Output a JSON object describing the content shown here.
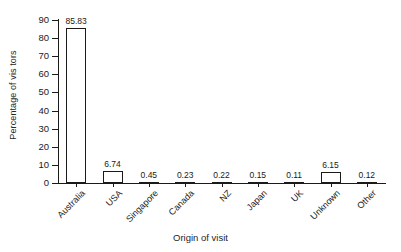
{
  "chart_data": {
    "type": "bar",
    "title": "",
    "xlabel": "Origin of visit",
    "ylabel": "Percentage of vis tors",
    "categories": [
      "Australia",
      "USA",
      "Singapore",
      "Canada",
      "NZ",
      "Japan",
      "UK",
      "Unknown",
      "Other"
    ],
    "values": [
      85.83,
      6.74,
      0.45,
      0.23,
      0.22,
      0.15,
      0.11,
      6.15,
      0.12
    ],
    "value_labels": [
      "85.83",
      "6.74",
      "0.45",
      "0.23",
      "0.22",
      "0.15",
      "0.11",
      "6.15",
      "0.12"
    ],
    "ylim": [
      0,
      90
    ],
    "y_ticks": [
      0,
      10,
      20,
      30,
      40,
      50,
      60,
      70,
      80,
      90
    ],
    "y_tick_labels": [
      "0",
      "10",
      "20",
      "30",
      "40",
      "50",
      "60",
      "70",
      "80",
      "90"
    ],
    "grid": false,
    "legend": false,
    "legend_position": "none",
    "bar_fill_color": "#ffffff",
    "bar_edge_color": "#1a1a1a",
    "axis_color": "#1a1a1a",
    "background_color": "#ffffff",
    "x_tick_label_rotation": 45
  }
}
